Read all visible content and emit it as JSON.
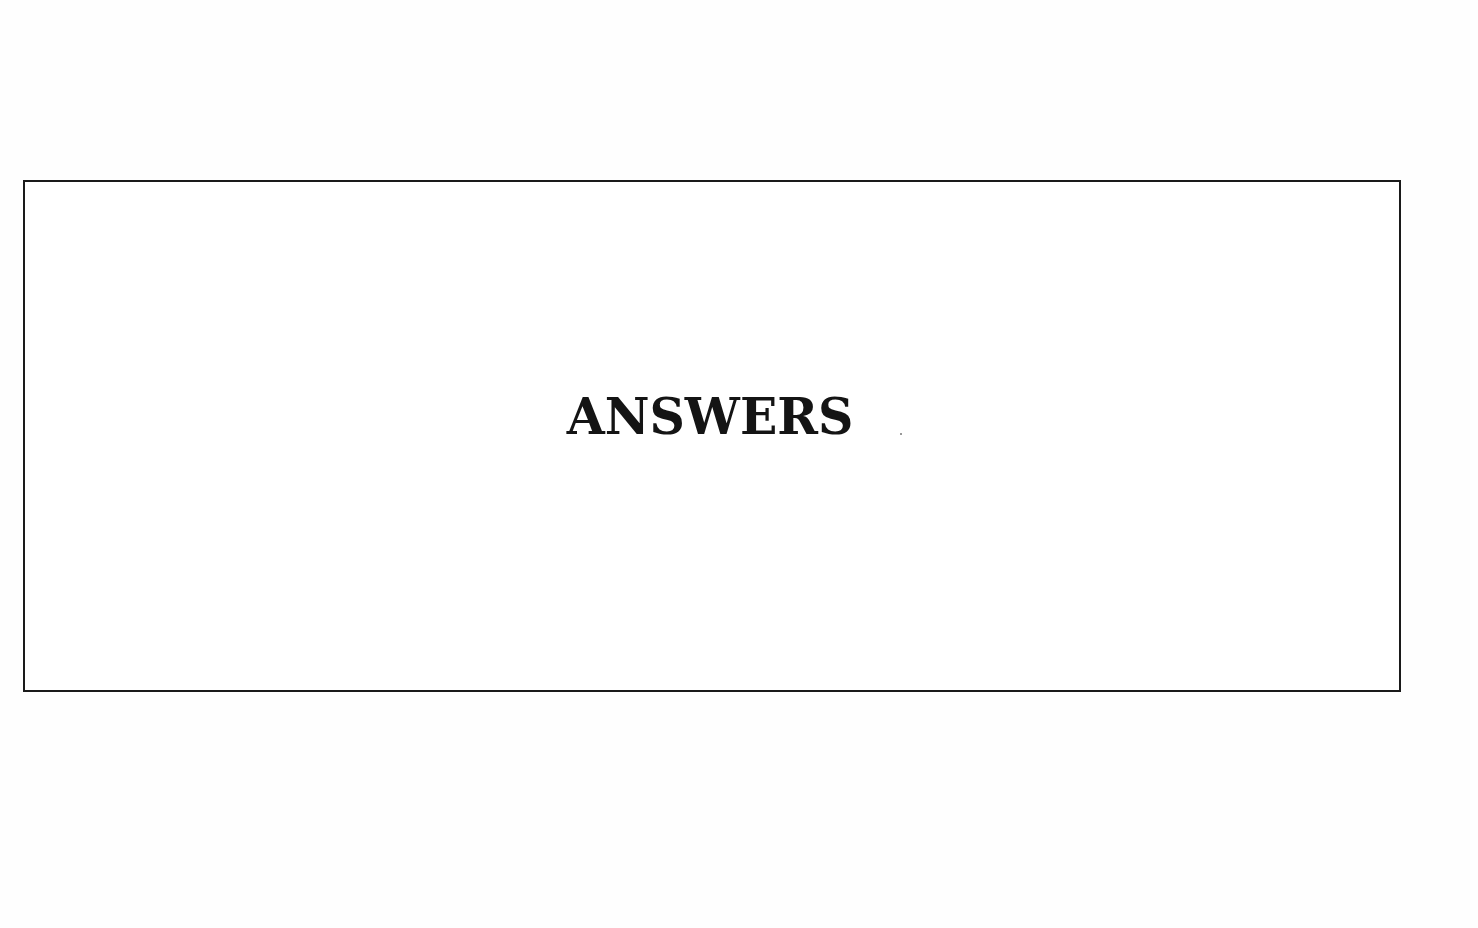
{
  "page": {
    "heading": "ANSWERS"
  },
  "colors": {
    "text": "#141414",
    "border": "#1a1a1a",
    "background": "#ffffff"
  }
}
